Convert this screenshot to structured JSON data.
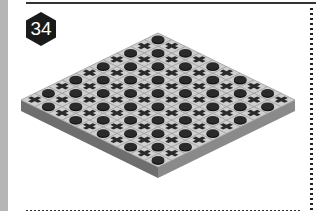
{
  "badge": {
    "number": "34",
    "color": "#1a1a1a"
  },
  "board": {
    "rows": 10,
    "cols": 10,
    "top_color": "#cfcfcf",
    "grid_color": "#9a9a9a",
    "piece_color": "#2a2a2a",
    "side_left_color": "#6e6e6e",
    "side_right_color": "#8a8a8a",
    "pattern": [
      "OXOXOXOXOX",
      "XOXOXOXOXO",
      "OXOXOXOXOX",
      "XOXOXOXOXO",
      "OXOXOXOXOX",
      "XOXOXOXOXO",
      "OXOXOXOXOX",
      "XOXOXOXOXO",
      "OXOXOXOXOX",
      "XOXOXOXOXO"
    ]
  }
}
